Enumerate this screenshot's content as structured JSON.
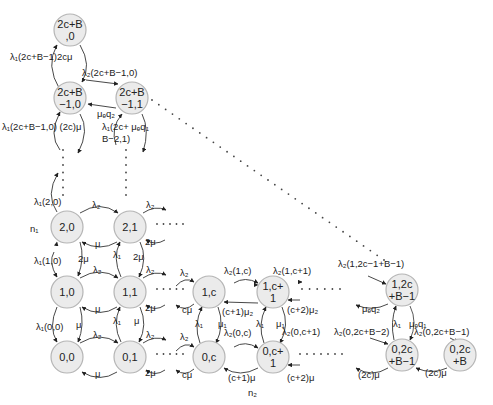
{
  "diagram": {
    "type": "state-transition-diagram",
    "axis_labels": {
      "n1": "n₁",
      "n2": "n₂"
    },
    "nodes": [
      {
        "id": "2c+B,0",
        "line1": "2c+B",
        "line2": ",0",
        "x": 70,
        "y": 30
      },
      {
        "id": "2c+B-1,0",
        "line1": "2c+B",
        "line2": "−1,0",
        "x": 70,
        "y": 98
      },
      {
        "id": "2c+B-1,1",
        "line1": "2c+B",
        "line2": "−1,1",
        "x": 132,
        "y": 98
      },
      {
        "id": "2,0",
        "line1": "2,0",
        "line2": "",
        "x": 67,
        "y": 227
      },
      {
        "id": "2,1",
        "line1": "2,1",
        "line2": "",
        "x": 130,
        "y": 227
      },
      {
        "id": "1,0",
        "line1": "1,0",
        "line2": "",
        "x": 67,
        "y": 292
      },
      {
        "id": "1,1",
        "line1": "1,1",
        "line2": "",
        "x": 130,
        "y": 292
      },
      {
        "id": "1,c",
        "line1": "1,c",
        "line2": "",
        "x": 209,
        "y": 292
      },
      {
        "id": "1,c+1",
        "line1": "1,c+",
        "line2": "1",
        "x": 273,
        "y": 292
      },
      {
        "id": "1,2c+B-1",
        "line1": "1,2c",
        "line2": "+B−1",
        "x": 402,
        "y": 290
      },
      {
        "id": "0,0",
        "line1": "0,0",
        "line2": "",
        "x": 67,
        "y": 357
      },
      {
        "id": "0,1",
        "line1": "0,1",
        "line2": "",
        "x": 130,
        "y": 357
      },
      {
        "id": "0,c",
        "line1": "0,c",
        "line2": "",
        "x": 209,
        "y": 357
      },
      {
        "id": "0,c+1",
        "line1": "0,c+",
        "line2": "1",
        "x": 273,
        "y": 357
      },
      {
        "id": "0,2c+B-1",
        "line1": "0,2c",
        "line2": "+B−1",
        "x": 402,
        "y": 355
      },
      {
        "id": "0,2c+B",
        "line1": "0,2c",
        "line2": "+B",
        "x": 460,
        "y": 355
      }
    ],
    "labels": [
      {
        "text": "λ₁(2c+B−1)2cμ",
        "x": 10,
        "y": 60
      },
      {
        "text": "λ₂(2c+B−1,0)",
        "x": 82,
        "y": 76
      },
      {
        "text": "μₑq₂",
        "x": 97,
        "y": 117
      },
      {
        "text": "λ₁(2c+B−1,0) (2c)μ",
        "x": 2,
        "y": 130
      },
      {
        "text": "λ₁(2c+ μₑq₁",
        "x": 102,
        "y": 130
      },
      {
        "text": "B−2,1)",
        "x": 102,
        "y": 142
      },
      {
        "text": "λ₁(2,0)",
        "x": 34,
        "y": 205
      },
      {
        "text": "n₁",
        "x": 30,
        "y": 232
      },
      {
        "text": "λ₂",
        "x": 92,
        "y": 208
      },
      {
        "text": "μ",
        "x": 95,
        "y": 247
      },
      {
        "text": "λ₂",
        "x": 146,
        "y": 208
      },
      {
        "text": "2μ",
        "x": 145,
        "y": 245
      },
      {
        "text": "λ₁(1,0)",
        "x": 34,
        "y": 264
      },
      {
        "text": "2μ",
        "x": 78,
        "y": 262
      },
      {
        "text": "λ₁",
        "x": 113,
        "y": 258
      },
      {
        "text": "2μ",
        "x": 133,
        "y": 260
      },
      {
        "text": "λ₂",
        "x": 93,
        "y": 273
      },
      {
        "text": "λ₂",
        "x": 146,
        "y": 273
      },
      {
        "text": "μ",
        "x": 95,
        "y": 312
      },
      {
        "text": "2μ",
        "x": 145,
        "y": 311
      },
      {
        "text": "λ₁(0,0)",
        "x": 36,
        "y": 330
      },
      {
        "text": "μ",
        "x": 76,
        "y": 328
      },
      {
        "text": "λ₁",
        "x": 113,
        "y": 324
      },
      {
        "text": "μ",
        "x": 134,
        "y": 324
      },
      {
        "text": "λ₂",
        "x": 93,
        "y": 338
      },
      {
        "text": "λ₂",
        "x": 146,
        "y": 338
      },
      {
        "text": "μ",
        "x": 95,
        "y": 377
      },
      {
        "text": "2μ",
        "x": 145,
        "y": 376
      },
      {
        "text": "λ₂",
        "x": 180,
        "y": 276
      },
      {
        "text": "cμ",
        "x": 182,
        "y": 313
      },
      {
        "text": "λ₂(1,c)",
        "x": 224,
        "y": 274
      },
      {
        "text": "λ₂(1,c+1)",
        "x": 273,
        "y": 274
      },
      {
        "text": "(c+1)μ₂",
        "x": 222,
        "y": 315
      },
      {
        "text": "(c+2)μ₂",
        "x": 287,
        "y": 313
      },
      {
        "text": "λ₁",
        "x": 195,
        "y": 327
      },
      {
        "text": "μ₁",
        "x": 218,
        "y": 327
      },
      {
        "text": "λ₁",
        "x": 256,
        "y": 327
      },
      {
        "text": "μ₁",
        "x": 276,
        "y": 327
      },
      {
        "text": "λ₂(0,c)",
        "x": 224,
        "y": 336
      },
      {
        "text": "λ₂(0,c+1)",
        "x": 282,
        "y": 335
      },
      {
        "text": "λ₂",
        "x": 180,
        "y": 340
      },
      {
        "text": "cμ",
        "x": 182,
        "y": 378
      },
      {
        "text": "(c+1)μ",
        "x": 228,
        "y": 381
      },
      {
        "text": "n₂",
        "x": 248,
        "y": 396
      },
      {
        "text": "(c+2)μ",
        "x": 287,
        "y": 381
      },
      {
        "text": "λ₂(1,2c−1+B−1)",
        "x": 338,
        "y": 267
      },
      {
        "text": "μₑq₂",
        "x": 362,
        "y": 312
      },
      {
        "text": "λ₁",
        "x": 393,
        "y": 327
      },
      {
        "text": "μₑq₁",
        "x": 409,
        "y": 327
      },
      {
        "text": "λ₂(0,2c+B−2)",
        "x": 334,
        "y": 335
      },
      {
        "text": "λ₂(0,2c+B−1)",
        "x": 414,
        "y": 335
      },
      {
        "text": "(2c)μ",
        "x": 358,
        "y": 378
      },
      {
        "text": "(2c)μ",
        "x": 425,
        "y": 376
      }
    ]
  }
}
